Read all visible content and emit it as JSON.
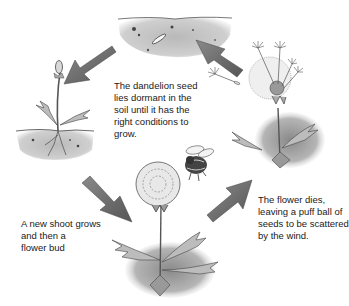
{
  "diagram": {
    "type": "life-cycle",
    "subject": "dandelion",
    "stages": [
      {
        "id": "seed-in-soil",
        "caption": "The dandelion seed\nlies dormant in the\nsoil until it has the\nright conditions to\ngrow."
      },
      {
        "id": "shoot-and-bud",
        "caption": "A new shoot grows\nand then a\nflower bud"
      },
      {
        "id": "flowering",
        "caption": ""
      },
      {
        "id": "seed-dispersal",
        "caption": "The flower dies,\nleaving a puff ball of\nseeds to be scattered\nby the wind."
      }
    ],
    "arrows": [
      {
        "from": "seed-in-soil",
        "to": "shoot-and-bud"
      },
      {
        "from": "shoot-and-bud",
        "to": "flowering"
      },
      {
        "from": "flowering",
        "to": "seed-dispersal"
      },
      {
        "from": "seed-dispersal",
        "to": "seed-in-soil"
      }
    ],
    "colors": {
      "arrow": "#6b6b6b",
      "soil": "#c4c4c4",
      "leaf": "#9a9a9a",
      "text": "#1a1a1a"
    }
  }
}
